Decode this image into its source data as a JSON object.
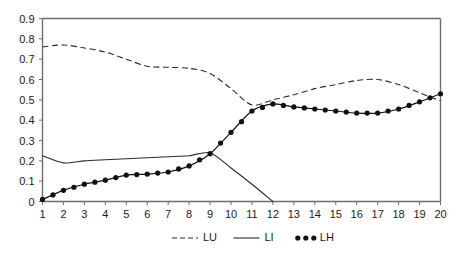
{
  "chart_data": {
    "type": "line",
    "title": "",
    "subtitle": "",
    "xlabel": "",
    "ylabel": "",
    "xlim": [
      1,
      20
    ],
    "ylim": [
      0,
      0.9
    ],
    "grid": false,
    "legend_position": "bottom-center",
    "x_ticks": [
      "1",
      "2",
      "3",
      "4",
      "5",
      "6",
      "7",
      "8",
      "9",
      "10",
      "11",
      "12",
      "13",
      "14",
      "15",
      "16",
      "17",
      "18",
      "19",
      "20"
    ],
    "y_ticks": [
      "0",
      "0.1",
      "0.2",
      "0.3",
      "0.4",
      "0.5",
      "0.6",
      "0.7",
      "0.8",
      "0.9"
    ],
    "x": [
      1,
      2,
      3,
      4,
      5,
      6,
      7,
      8,
      9,
      10,
      11,
      12,
      13,
      14,
      15,
      16,
      17,
      18,
      19,
      20
    ],
    "series": [
      {
        "name": "LU",
        "style": "dashed",
        "marker": "none",
        "color": "#2b2b2b",
        "values": [
          0.76,
          0.77,
          0.755,
          0.735,
          0.7,
          0.665,
          0.66,
          0.655,
          0.63,
          0.555,
          0.475,
          0.5,
          0.525,
          0.555,
          0.575,
          0.595,
          0.6,
          0.575,
          0.535,
          0.495
        ]
      },
      {
        "name": "LI",
        "style": "solid",
        "marker": "none",
        "color": "#2b2b2b",
        "values": [
          0.225,
          0.19,
          0.2,
          0.205,
          0.21,
          0.215,
          0.22,
          0.225,
          0.24,
          0.165,
          0.085,
          0.0,
          null,
          null,
          null,
          null,
          null,
          null,
          null,
          null
        ]
      },
      {
        "name": "LH",
        "style": "solid",
        "marker": "filled-circle",
        "color": "#111111",
        "marker_interval": 0.5,
        "values": [
          0.01,
          0.055,
          0.085,
          0.105,
          0.13,
          0.135,
          0.145,
          0.175,
          0.235,
          0.34,
          0.445,
          0.48,
          0.465,
          0.455,
          0.445,
          0.435,
          0.435,
          0.455,
          0.49,
          0.53
        ]
      }
    ]
  },
  "legend": {
    "items": [
      {
        "label": "LU",
        "style": "dashed"
      },
      {
        "label": "LI",
        "style": "solid"
      },
      {
        "label": "LH",
        "style": "dotted-markers"
      }
    ]
  }
}
